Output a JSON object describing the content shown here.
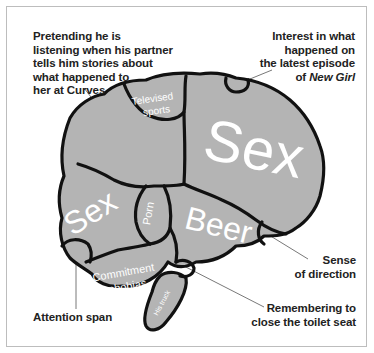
{
  "colors": {
    "brain_fill": "#b4b4b4",
    "outline": "#111111",
    "region_text": "#ffffff",
    "label_text": "#222222",
    "frame": "#bdbdbd",
    "leader_line": "#555555"
  },
  "callouts": {
    "pretending": [
      "Pretending he is",
      "listening when his partner",
      "tells him stories about",
      "what happened to",
      "her at Curves"
    ],
    "new_girl": {
      "lines": [
        "Interest in what",
        "happened on",
        "the latest episode"
      ],
      "last_prefix": "of ",
      "last_italic": "New Girl"
    },
    "sense_direction": [
      "Sense",
      "of direction"
    ],
    "toilet_seat": [
      "Remembering to",
      "close the toilet seat"
    ],
    "attention_span": "Attention span"
  },
  "regions": {
    "televised_sports": [
      "Televised",
      "sports"
    ],
    "sex_large": "Sex",
    "sex_small": "Sex",
    "porn": "Porn",
    "beer": "Beer",
    "commitment_phobias": [
      "Commitment",
      "phobias"
    ],
    "his_truck": "His truck"
  }
}
